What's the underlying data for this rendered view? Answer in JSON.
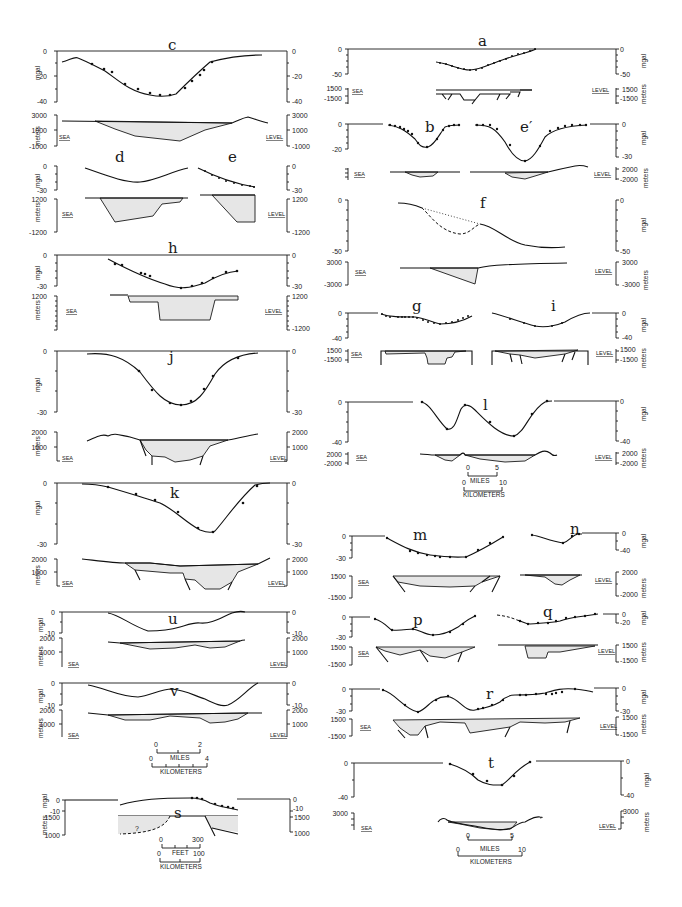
{
  "figure": {
    "axis_units": {
      "gravity": "mgal",
      "elevation": "meters"
    },
    "datum_labels": {
      "left": "SEA",
      "right": "LEVEL"
    }
  },
  "panels": {
    "c": {
      "label": "c",
      "gravity_ticks": [
        "0",
        "-20",
        "-40"
      ],
      "gravity_ticks_right": [
        "0",
        "-20",
        "-40"
      ],
      "meters_ticks": [
        "3000",
        "1000",
        "-1000"
      ],
      "meters_ticks_right": [
        "3000",
        "1000",
        "-1000"
      ]
    },
    "d": {
      "label": "d",
      "gravity_ticks": [
        "0",
        "-30"
      ],
      "meters_ticks": [
        "1200",
        "-1200"
      ]
    },
    "e": {
      "label": "e",
      "gravity_ticks_right": [
        "0",
        "-30"
      ],
      "meters_ticks_right": [
        "1200",
        "-1200"
      ]
    },
    "h": {
      "label": "h",
      "gravity_ticks": [
        "0",
        "-30"
      ],
      "gravity_ticks_right": [
        "0",
        "-30"
      ],
      "meters_ticks": [
        "1200",
        "-1200"
      ],
      "meters_ticks_right": [
        "1200",
        "-1200"
      ]
    },
    "j": {
      "label": "j",
      "gravity_ticks": [
        "0",
        "-30"
      ],
      "gravity_ticks_right": [
        "0",
        "-30"
      ],
      "meters_ticks": [
        "2000",
        "1000"
      ],
      "meters_ticks_right": [
        "2000",
        "1000"
      ]
    },
    "k": {
      "label": "k",
      "gravity_ticks": [
        "0",
        "-30"
      ],
      "gravity_ticks_right": [
        "0",
        "-30"
      ],
      "meters_ticks": [
        "2000",
        "1000"
      ],
      "meters_ticks_right": [
        "2000",
        "1000"
      ]
    },
    "u": {
      "label": "u",
      "gravity_ticks": [
        "0",
        "-10"
      ],
      "gravity_ticks_right": [
        "0",
        "-10"
      ],
      "meters_ticks": [
        "2000",
        "1000"
      ],
      "meters_ticks_right": [
        "2000",
        "1000"
      ]
    },
    "v": {
      "label": "v",
      "gravity_ticks": [
        "0",
        "-10"
      ],
      "gravity_ticks_right": [
        "0",
        "-10"
      ],
      "meters_ticks": [
        "2000",
        "1000"
      ],
      "meters_ticks_right": [
        "2000",
        "1000"
      ]
    },
    "s": {
      "label": "s",
      "gravity_ticks": [
        "0",
        "-10"
      ],
      "gravity_ticks_right": [
        "0",
        "-10"
      ],
      "meters_ticks": [
        "1500",
        "1000"
      ],
      "meters_ticks_right": [
        "1500",
        "1000"
      ],
      "question_mark": "?"
    },
    "a": {
      "label": "a",
      "gravity_ticks": [
        "0",
        "-50"
      ],
      "gravity_ticks_right": [
        "0",
        "-50"
      ],
      "meters_ticks": [
        "1500",
        "-1500"
      ],
      "meters_ticks_right": [
        "1500",
        "-1500"
      ]
    },
    "b": {
      "label": "b",
      "gravity_ticks": [
        "0",
        "-20"
      ]
    },
    "e_prime": {
      "label": "e′",
      "gravity_ticks_right": [
        "0",
        "-30"
      ],
      "meters_ticks_right": [
        "2000",
        "-2000"
      ]
    },
    "f": {
      "label": "f",
      "gravity_ticks": [
        "0",
        "-50"
      ],
      "gravity_ticks_right": [
        "0",
        "-50"
      ],
      "meters_ticks": [
        "3000",
        "-3000"
      ],
      "meters_ticks_right": [
        "3000",
        "-3000"
      ]
    },
    "g": {
      "label": "g",
      "gravity_ticks": [
        "0",
        "-40"
      ],
      "meters_ticks": [
        "1500",
        "-1500"
      ]
    },
    "i": {
      "label": "i",
      "gravity_ticks_right": [
        "0",
        "-40"
      ],
      "meters_ticks_right": [
        "1500",
        "-1500"
      ]
    },
    "l": {
      "label": "l",
      "gravity_ticks": [
        "0",
        "-40"
      ],
      "gravity_ticks_right": [
        "0",
        "-40"
      ],
      "meters_ticks": [
        "2000",
        "-2000"
      ],
      "meters_ticks_right": [
        "2000",
        "-2000"
      ]
    },
    "m": {
      "label": "m",
      "gravity_ticks": [
        "0",
        "-30"
      ],
      "meters_ticks": [
        "1500",
        "-1500"
      ]
    },
    "n": {
      "label": "n",
      "gravity_ticks_right": [
        "0",
        "-40"
      ],
      "meters_ticks_right": [
        "2000",
        "-2000"
      ]
    },
    "p": {
      "label": "p",
      "gravity_ticks": [
        "0",
        "-30"
      ],
      "meters_ticks": [
        "1500",
        "-1500"
      ]
    },
    "q": {
      "label": "q",
      "gravity_ticks_right": [
        "0",
        "-20"
      ],
      "meters_ticks_right": [
        "1500",
        "-1500"
      ]
    },
    "r": {
      "label": "r",
      "gravity_ticks": [
        "0",
        "-30"
      ],
      "gravity_ticks_right": [
        "0",
        "-30"
      ],
      "meters_ticks": [
        "1500",
        "-1500"
      ],
      "meters_ticks_right": [
        "1500",
        "-1500"
      ]
    },
    "t": {
      "label": "t",
      "gravity_ticks": [
        "0",
        "-40"
      ],
      "gravity_ticks_right": [
        "0",
        "-40"
      ],
      "meters_ticks": [
        "3000"
      ],
      "meters_ticks_right": [
        "3000"
      ]
    }
  },
  "scale_bars": {
    "l_scale": {
      "miles": [
        "0",
        "5"
      ],
      "miles_label": "MILES",
      "km": [
        "0",
        "10"
      ],
      "km_label": "KILOMETERS"
    },
    "uv_scale": {
      "miles": [
        "0",
        "2"
      ],
      "miles_label": "MILES",
      "km": [
        "0",
        "4"
      ],
      "km_label": "KILOMETERS"
    },
    "s_scale": {
      "feet": [
        "0",
        "300"
      ],
      "feet_label": "FEET",
      "km": [
        "0",
        "100"
      ],
      "km_label": "KILOMETERS"
    },
    "t_scale": {
      "miles": [
        "0",
        "5"
      ],
      "miles_label": "MILES",
      "km": [
        "0",
        "10"
      ],
      "km_label": "KILOMETERS"
    }
  }
}
